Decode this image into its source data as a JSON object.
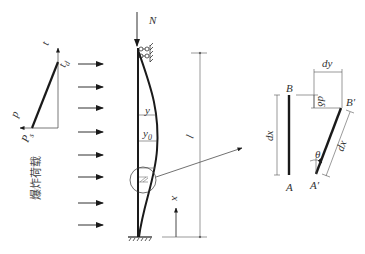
{
  "diagram": {
    "load_graph": {
      "axis_time_label": "t",
      "duration_label": "t",
      "duration_subscript": "d",
      "axis_pressure_label": "p",
      "peak_label": "P",
      "peak_subscript": "s",
      "caption": "爆炸荷载"
    },
    "column": {
      "axial_load_label": "N",
      "deflection_label": "y",
      "initial_deflection_label": "y",
      "initial_deflection_subscript": "0",
      "length_label": "l",
      "coordinate_label": "x",
      "load_arrow_count": 8
    },
    "element_detail": {
      "original_top": "B",
      "original_bottom": "A",
      "original_length": "dx",
      "deformed_top": "B′",
      "deformed_bottom": "A′",
      "deformed_length": "dx",
      "lateral_offset": "dy",
      "vertical_shortening": "dδ",
      "rotation_angle": "θ"
    },
    "colors": {
      "line": "#1a1a1a",
      "thin_line": "#555555",
      "text": "#333333"
    }
  }
}
